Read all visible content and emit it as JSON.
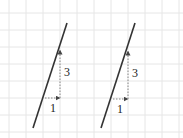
{
  "figure": {
    "grid": {
      "color": "#e6e6e6",
      "spacing": 17,
      "x0": 9,
      "y0": 13,
      "width": 183,
      "height": 138
    },
    "line_color": "#333333",
    "guide_color": "#888888",
    "panels": [
      {
        "name": "left",
        "line": {
          "x1": 67,
          "y1": 23,
          "x2": 33,
          "y2": 128
        },
        "run": {
          "x1": 45,
          "y1": 98,
          "x2": 60,
          "y2": 98,
          "label": "1",
          "label_x": 50,
          "label_y": 112
        },
        "rise": {
          "x1": 60,
          "y1": 98,
          "x2": 60,
          "y2": 50,
          "label": "3",
          "label_x": 64,
          "label_y": 76
        }
      },
      {
        "name": "right",
        "line": {
          "x1": 135,
          "y1": 23,
          "x2": 101,
          "y2": 128
        },
        "run": {
          "x1": 113,
          "y1": 99,
          "x2": 128,
          "y2": 99,
          "label": "1",
          "label_x": 117,
          "label_y": 113
        },
        "rise": {
          "x1": 128,
          "y1": 99,
          "x2": 128,
          "y2": 51,
          "label": "3",
          "label_x": 132,
          "label_y": 77
        }
      }
    ]
  }
}
